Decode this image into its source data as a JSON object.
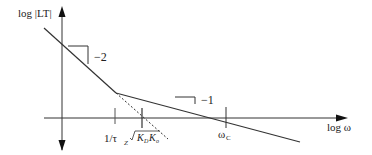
{
  "diagram": {
    "type": "bode-magnitude-asymptote",
    "y_axis_label": "log |LT|",
    "x_axis_label": "log ω",
    "slope_labels": {
      "steep": "−2",
      "shallow": "−1"
    },
    "x_markers": {
      "zero_freq": "1/τ",
      "zero_freq_sub": "Z",
      "sqrt_label": "K",
      "sqrt_sub1": "D",
      "sqrt_sub2": "o",
      "crossover": "ω",
      "crossover_sub": "C"
    },
    "colors": {
      "line": "#333333",
      "background": "#ffffff"
    }
  }
}
